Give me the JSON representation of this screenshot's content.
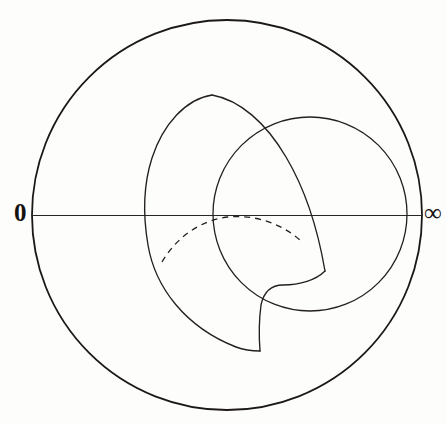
{
  "figure": {
    "type": "geometric-diagram",
    "width": 446,
    "height": 424,
    "background_color": "#fdfdfc",
    "ink_color": "#1b1815"
  },
  "labels": {
    "left_endpoint": "0",
    "right_endpoint": "∞"
  },
  "geometry": {
    "outer_circle": {
      "name": "boundary-circle",
      "cx": 227,
      "cy": 215,
      "r": 195,
      "stroke_width": 1.7,
      "style": "solid"
    },
    "diameter_axis": {
      "name": "real-axis",
      "x1": 32,
      "y1": 215,
      "x2": 422,
      "y2": 215,
      "stroke_width": 1.2,
      "style": "solid"
    },
    "right_circle": {
      "name": "right-isometric-circle",
      "cx": 310,
      "cy": 214,
      "r": 97,
      "stroke_width": 1.3,
      "style": "solid"
    },
    "left_arc": {
      "name": "left-boundary-arc",
      "description": "large circular arc through the upper cusp and lower cusp, crossing the axis left of centre",
      "axis_crossing_x": 148,
      "stroke_width": 1.3,
      "style": "solid"
    },
    "dashed_arc": {
      "name": "hidden-geodesic-arc",
      "start": [
        162,
        262
      ],
      "apex": [
        228,
        217
      ],
      "end": [
        303,
        243
      ],
      "stroke_width": 1.3,
      "style": "dashed",
      "dash_pattern": "6 5"
    },
    "cusps": [
      {
        "name": "upper-cusp",
        "x": 212,
        "y": 95
      },
      {
        "name": "lower-cusp",
        "x": 260,
        "y": 351
      },
      {
        "name": "right-cusp",
        "x": 325,
        "y": 271
      }
    ]
  }
}
